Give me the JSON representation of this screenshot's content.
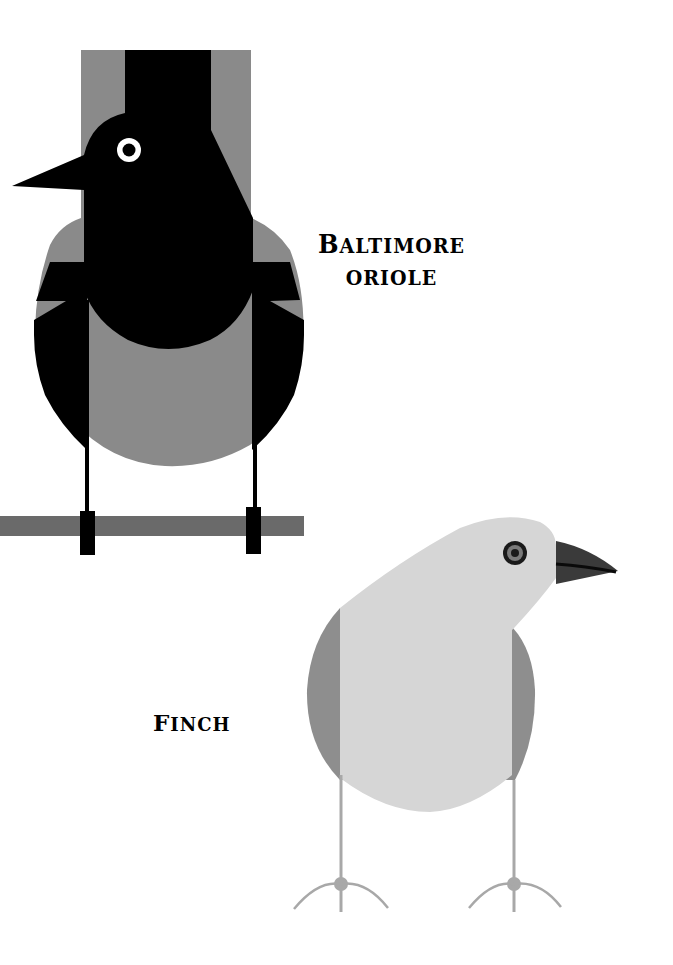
{
  "illustration": {
    "colors": {
      "background": "#ffffff",
      "oriole_black": "#000000",
      "oriole_gray": "#8a8a8a",
      "perch": "#6a6a6a",
      "finch_light": "#d6d6d6",
      "finch_mid": "#8e8e8e",
      "finch_beak": "#3a3a3a",
      "finch_legs": "#a8a8a8",
      "eye_white": "#ffffff"
    },
    "birds": [
      {
        "name": "oriole",
        "label_line1_initial": "B",
        "label_line1_rest": "altimore",
        "label_line2": "oriole"
      },
      {
        "name": "finch",
        "label_initial": "F",
        "label_rest": "inch"
      }
    ]
  }
}
